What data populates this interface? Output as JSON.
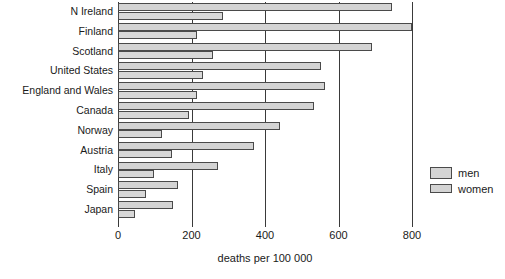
{
  "chart_data": {
    "type": "bar",
    "orientation": "horizontal",
    "title": "",
    "xlabel": "deaths per 100 000",
    "ylabel": "",
    "xlim": [
      0,
      800
    ],
    "xticks": [
      0,
      200,
      400,
      600,
      800
    ],
    "xtick_labels": [
      "0",
      "200",
      "400",
      "600",
      "800"
    ],
    "grid": true,
    "legend_position": "right",
    "categories": [
      "N Ireland",
      "Finland",
      "Scotland",
      "United States",
      "England and Wales",
      "Canada",
      "Norway",
      "Austria",
      "Italy",
      "Spain",
      "Japan"
    ],
    "series": [
      {
        "name": "men",
        "color": "#d4d4d4",
        "values": [
          745,
          800,
          690,
          552,
          562,
          532,
          440,
          370,
          272,
          162,
          150
        ]
      },
      {
        "name": "women",
        "color": "#d8d8d8",
        "values": [
          285,
          215,
          258,
          232,
          215,
          192,
          120,
          148,
          98,
          75,
          45
        ]
      }
    ]
  },
  "legend": {
    "items": [
      {
        "label": "men"
      },
      {
        "label": "women"
      }
    ]
  },
  "axis": {
    "x_title": "deaths per 100 000"
  }
}
